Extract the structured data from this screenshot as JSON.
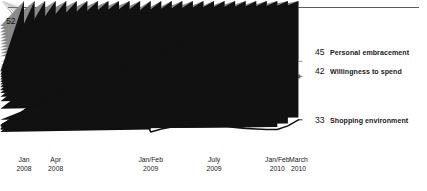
{
  "figure": {
    "name": "consumer-sentiment-index-line-chart",
    "has_top_rule": true,
    "background": "#ffffff"
  },
  "chart_data": {
    "type": "line",
    "title": "",
    "subtitle": "",
    "xlabel": "",
    "ylabel": "",
    "grid": false,
    "legend_position": "right-inline",
    "xlim": [
      0,
      27
    ],
    "ylim": [
      29,
      54
    ],
    "x_tick_labels": [
      {
        "line1": "Jan",
        "line2": "2008",
        "index": 0
      },
      {
        "line1": "Apr",
        "line2": "2008",
        "index": 3
      },
      {
        "line1": "Jan/Feb",
        "line2": "2009",
        "index": 12
      },
      {
        "line1": "July",
        "line2": "2009",
        "index": 18
      },
      {
        "line1": "Jan/Feb",
        "line2": "2010",
        "index": 24
      },
      {
        "line1": "March",
        "line2": "2010",
        "index": 26
      }
    ],
    "start_value_labels": [
      {
        "value": "52",
        "series": "Personal embracement"
      },
      {
        "value": "43",
        "series": "Shopping environment"
      },
      {
        "value": "43",
        "series": "Willingness to spend"
      }
    ],
    "series": [
      {
        "name": "Personal embracement",
        "end_label": "45",
        "marker": "diamond",
        "color": "#8a8a8a",
        "start_value": 52,
        "values": [
          52,
          51.4,
          50.8,
          50.2,
          49.6,
          49.0,
          48.4,
          47.8,
          47.2,
          46.6,
          46.0,
          44.0,
          39.2,
          39.4,
          39.4,
          41.6,
          42.6,
          41.4,
          39.4,
          40.6,
          42.4,
          41.8,
          39.8,
          41.2,
          42.6,
          44.4,
          45.0
        ]
      },
      {
        "name": "Willingness to spend",
        "end_label": "42",
        "marker": "square",
        "color": "#6e6e6e",
        "start_value": 43,
        "values": [
          43,
          43.0,
          42.4,
          43.0,
          42.6,
          42.0,
          41.2,
          40.0,
          38.8,
          38.2,
          38.2,
          38.2,
          40.2,
          40.4,
          42.6,
          43.4,
          42.4,
          42.6,
          43.6,
          43.2,
          42.0,
          41.8,
          42.8,
          43.0,
          43.0,
          42.2,
          42.0
        ]
      },
      {
        "name": "Shopping environment",
        "end_label": "33",
        "marker": "triangle",
        "color": "#111111",
        "start_value": 43,
        "values": [
          43,
          42.4,
          41.9,
          41.4,
          40.9,
          40.4,
          39.9,
          39.3,
          38.7,
          38.0,
          37.1,
          35.6,
          31.0,
          31.6,
          32.0,
          32.2,
          32.3,
          32.4,
          32.4,
          32.2,
          31.9,
          31.7,
          31.6,
          31.5,
          31.5,
          32.2,
          33.4
        ]
      }
    ]
  }
}
